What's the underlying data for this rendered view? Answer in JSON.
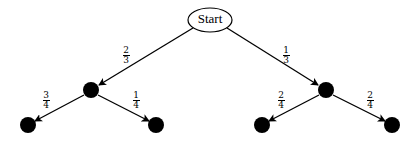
{
  "diagram": {
    "type": "probability-tree",
    "root": {
      "label": "Start"
    },
    "edges": [
      {
        "from": "Start",
        "to": "A",
        "label": {
          "num": "2",
          "den": "3"
        }
      },
      {
        "from": "Start",
        "to": "B",
        "label": {
          "num": "1",
          "den": "3"
        }
      },
      {
        "from": "A",
        "to": "A1",
        "label": {
          "num": "3",
          "den": "4"
        }
      },
      {
        "from": "A",
        "to": "A2",
        "label": {
          "num": "1",
          "den": "4"
        }
      },
      {
        "from": "B",
        "to": "B1",
        "label": {
          "num": "2",
          "den": "4"
        }
      },
      {
        "from": "B",
        "to": "B2",
        "label": {
          "num": "2",
          "den": "4"
        }
      }
    ],
    "colors": {
      "line": "#000000",
      "node": "#000000",
      "background": "#ffffff"
    }
  }
}
